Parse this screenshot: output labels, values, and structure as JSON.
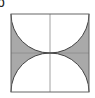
{
  "figure": {
    "label": "b",
    "square": {
      "x": 11,
      "y": 14,
      "size": 78
    },
    "colors": {
      "shade": "#a9a9a9",
      "stroke": "#555555",
      "grid": "#8a8a8a",
      "background": "#ffffff"
    }
  }
}
